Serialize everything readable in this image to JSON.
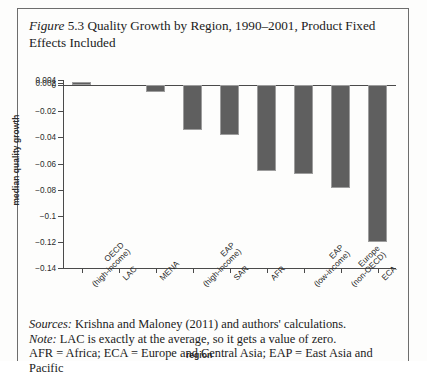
{
  "caption": {
    "label": "Figure",
    "number": "5.3",
    "text": " Quality Growth by Region, 1990–2001, Product Fixed Effects Included"
  },
  "chart_data": {
    "type": "bar",
    "title": "Quality Growth by Region, 1990–2001, Product Fixed Effects Included",
    "xlabel": "region",
    "ylabel": "median quality growth",
    "ylim": [
      -0.14,
      0.004
    ],
    "grid": false,
    "legend": "none",
    "yticks": [
      "0.004",
      "0.002",
      "0",
      "−0.02",
      "−0.04",
      "−0.06",
      "−0.08",
      "−0.1",
      "−0.12",
      "−0.14"
    ],
    "ytick_values": [
      0.004,
      0.002,
      0,
      -0.02,
      -0.04,
      -0.06,
      -0.08,
      -0.1,
      -0.12,
      -0.14
    ],
    "categories": [
      "OECD (high-income)",
      "LAC",
      "MENA",
      "EAP (high-income)",
      "SAR",
      "AFR",
      "EAP (low-income)",
      "Europe (non-OECD)",
      "ECA"
    ],
    "category_lines": [
      [
        "OECD",
        "(high-income)"
      ],
      [
        "LAC",
        ""
      ],
      [
        "MENA",
        ""
      ],
      [
        "EAP",
        "(high-income)"
      ],
      [
        "SAR",
        ""
      ],
      [
        "AFR",
        ""
      ],
      [
        "EAP",
        "(low-income)"
      ],
      [
        "Europe",
        "(non-OECD)"
      ],
      [
        "ECA",
        ""
      ]
    ],
    "values": [
      0.0027,
      0,
      -0.005,
      -0.0345,
      -0.0385,
      -0.066,
      -0.068,
      -0.079,
      -0.12
    ],
    "bar_color": "#5f5f5f"
  },
  "notes": {
    "sources_lead": "Sources:",
    "sources_text": " Krishna and Maloney (2011) and authors' calculations.",
    "note_lead": "Note:",
    "note_text": " LAC is exactly at the average, so it gets a value of zero.",
    "abbrev_text": "AFR = Africa; ECA = Europe and Central Asia; EAP = East Asia and Pacific"
  }
}
